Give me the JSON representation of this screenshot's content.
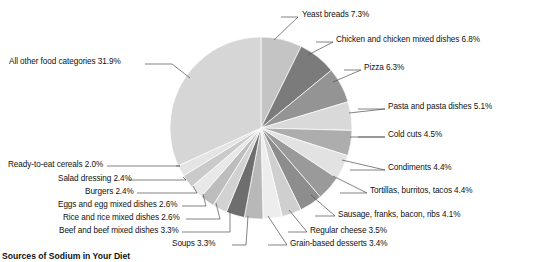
{
  "caption": "Sources of Sodium in Your Diet",
  "chart_data": {
    "type": "pie",
    "title": "Sources of Sodium in Your Diet",
    "units": "percent",
    "legend": "none",
    "start_angle_deg": -90,
    "direction": "clockwise",
    "center": {
      "x": 261,
      "y": 128
    },
    "radius": 91,
    "total": 100.0,
    "categories": [
      "Yeast breads",
      "Chicken and chicken mixed dishes",
      "Pizza",
      "Pasta and pasta dishes",
      "Cold cuts",
      "Condiments",
      "Tortillas, burritos, tacos",
      "Sausage, franks, bacon, ribs",
      "Regular cheese",
      "Grain-based desserts",
      "Soups",
      "Beef and beef mixed dishes",
      "Rice and rice mixed dishes",
      "Eggs and egg mixed dishes",
      "Burgers",
      "Salad dressing",
      "Ready-to-eat cereals",
      "All other food categories"
    ],
    "values": [
      7.3,
      6.8,
      6.3,
      5.1,
      4.5,
      4.4,
      4.4,
      4.1,
      3.5,
      3.4,
      3.3,
      3.3,
      2.6,
      2.6,
      2.4,
      2.4,
      2.0,
      31.9
    ],
    "colors": [
      "#c4c4c4",
      "#7b7b7b",
      "#949494",
      "#d9d9d9",
      "#adadad",
      "#e2e2e2",
      "#9a9a9a",
      "#8d8d8d",
      "#cfcfcf",
      "#ededed",
      "#b8b8b8",
      "#6e6e6e",
      "#d2d2d2",
      "#bdbdbd",
      "#e8e8e8",
      "#cacaca",
      "#e4e4e4",
      "#d6d6d6"
    ],
    "slice_labels": [
      "Yeast breads 7.3%",
      "Chicken and chicken mixed dishes 6.8%",
      "Pizza 6.3%",
      "Pasta and pasta dishes 5.1%",
      "Cold cuts 4.5%",
      "Condiments 4.4%",
      "Tortillas, burritos, tacos 4.4%",
      "Sausage, franks, bacon, ribs 4.1%",
      "Regular cheese 3.5%",
      "Grain-based desserts 3.4%",
      "Soups 3.3%",
      "Beef and beef mixed dishes 3.3%",
      "Rice and rice mixed dishes 2.6%",
      "Eggs and egg mixed dishes 2.6%",
      "Burgers 2.4%",
      "Salad dressing 2.4%",
      "Ready-to-eat cereals 2.0%",
      "All other food categories 31.9%"
    ]
  },
  "labels": [
    {
      "text": "Yeast breads 7.3%",
      "x": 302,
      "y": 10,
      "side": "right",
      "lx1": 281,
      "ly1": 17,
      "lx2": 298,
      "ly2": 17,
      "ax": 274,
      "ay": 40
    },
    {
      "text": "Chicken and chicken mixed dishes 6.8%",
      "x": 336,
      "y": 35,
      "side": "right",
      "lx1": 316,
      "ly1": 42,
      "lx2": 333,
      "ly2": 42,
      "ax": 308,
      "ay": 55
    },
    {
      "text": "Pizza 6.3%",
      "x": 364,
      "y": 63,
      "side": "right",
      "lx1": 344,
      "ly1": 70,
      "lx2": 361,
      "ly2": 70,
      "ax": 333,
      "ay": 82
    },
    {
      "text": "Pasta and pasta dishes 5.1%",
      "x": 388,
      "y": 102,
      "side": "right",
      "lx1": 358,
      "ly1": 109,
      "lx2": 385,
      "ly2": 109,
      "ax": 349,
      "ay": 113
    },
    {
      "text": "Cold cuts 4.5%",
      "x": 388,
      "y": 130,
      "side": "right",
      "lx1": 358,
      "ly1": 137,
      "lx2": 385,
      "ly2": 137,
      "ax": 350,
      "ay": 137
    },
    {
      "text": "Condiments 4.4%",
      "x": 388,
      "y": 163,
      "side": "right",
      "lx1": 350,
      "ly1": 170,
      "lx2": 385,
      "ly2": 170,
      "ax": 342,
      "ay": 160
    },
    {
      "text": "Tortillas, burritos, tacos 4.4%",
      "x": 370,
      "y": 186,
      "side": "right",
      "lx1": 340,
      "ly1": 193,
      "lx2": 367,
      "ly2": 193,
      "ax": 333,
      "ay": 176
    },
    {
      "text": "Sausage, franks, bacon, ribs 4.1%",
      "x": 338,
      "y": 210,
      "side": "right",
      "lx1": 315,
      "ly1": 216,
      "lx2": 335,
      "ly2": 216,
      "ax": 311,
      "ay": 195
    },
    {
      "text": "Regular cheese 3.5%",
      "x": 310,
      "y": 226,
      "side": "right",
      "lx1": 288,
      "ly1": 232,
      "lx2": 307,
      "ly2": 232,
      "ax": 289,
      "ay": 210
    },
    {
      "text": "Grain-based desserts 3.4%",
      "x": 290,
      "y": 239,
      "side": "right",
      "lx1": 268,
      "ly1": 245,
      "lx2": 287,
      "ly2": 245,
      "ax": 268,
      "ay": 216
    },
    {
      "text": "Soups 3.3%",
      "x": 172,
      "y": 239,
      "side": "left",
      "lx1": 232,
      "ly1": 245,
      "lx2": 246,
      "ly2": 245,
      "ax": 248,
      "ay": 216
    },
    {
      "text": "Beef and beef mixed dishes 3.3%",
      "x": 59,
      "y": 226,
      "side": "left",
      "lx1": 182,
      "ly1": 232,
      "lx2": 230,
      "ly2": 232,
      "ax": 230,
      "ay": 211
    },
    {
      "text": "Rice and rice mixed dishes 2.6%",
      "x": 63,
      "y": 213,
      "side": "left",
      "lx1": 186,
      "ly1": 219,
      "lx2": 220,
      "ly2": 219,
      "ax": 216,
      "ay": 203
    },
    {
      "text": "Eggs and egg mixed dishes 2.6%",
      "x": 58,
      "y": 200,
      "side": "left",
      "lx1": 182,
      "ly1": 206,
      "lx2": 206,
      "ly2": 206,
      "ax": 203,
      "ay": 194
    },
    {
      "text": "Burgers 2.4%",
      "x": 85,
      "y": 187,
      "side": "left",
      "lx1": 137,
      "ly1": 193,
      "lx2": 197,
      "ly2": 193,
      "ax": 193,
      "ay": 186
    },
    {
      "text": "Salad dressing 2.4%",
      "x": 58,
      "y": 174,
      "side": "left",
      "lx1": 128,
      "ly1": 180,
      "lx2": 186,
      "ly2": 180,
      "ax": 183,
      "ay": 177
    },
    {
      "text": "Ready-to-eat cereals 2.0%",
      "x": 8,
      "y": 160,
      "side": "left",
      "lx1": 107,
      "ly1": 166,
      "lx2": 180,
      "ly2": 166,
      "ax": 176,
      "ay": 166
    },
    {
      "text": "All other food categories 31.9%",
      "x": 9,
      "y": 57,
      "side": "left",
      "lx1": 145,
      "ly1": 64,
      "lx2": 172,
      "ly2": 64,
      "ax": 190,
      "ay": 78
    }
  ]
}
